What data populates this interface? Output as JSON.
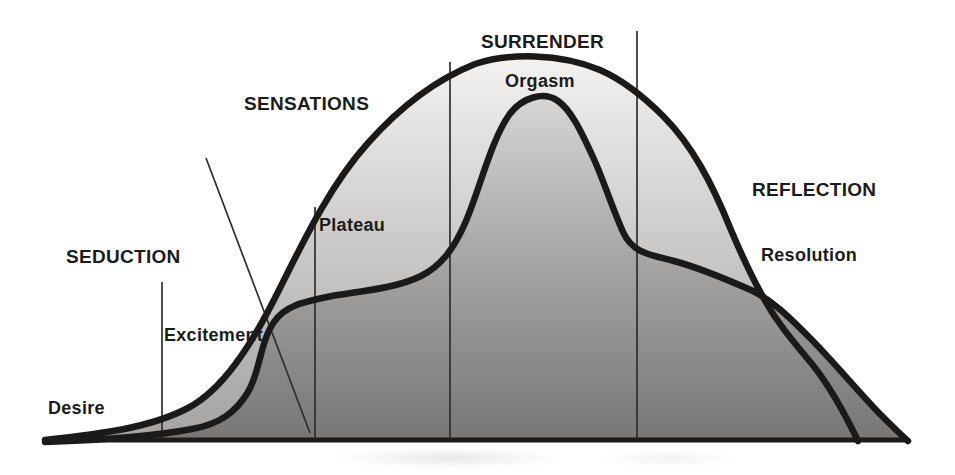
{
  "labels": {
    "seduction": "SEDUCTION",
    "sensations": "SENSATIONS",
    "surrender": "SURRENDER",
    "reflection": "REFLECTION",
    "desire": "Desire",
    "excitement": "Excitement",
    "plateau": "Plateau",
    "orgasm": "Orgasm",
    "resolution": "Resolution"
  },
  "diagram": {
    "kind": "dual-curve response-cycle diagram (scanned book figure)",
    "phases": [
      "SEDUCTION",
      "SENSATIONS",
      "SURRENDER",
      "REFLECTION"
    ],
    "stages": [
      "Desire",
      "Excitement",
      "Plateau",
      "Orgasm",
      "Resolution"
    ],
    "curves": [
      {
        "name": "outer-envelope-curve",
        "description": "large bell curve spanning all four phases, rising from Desire, peaking over Surrender, falling through Reflection to the baseline",
        "stroke": "#1a1a1a"
      },
      {
        "name": "inner-response-curve",
        "description": "curve rising steeply through Excitement, flattening at Plateau, spiking to the Orgasm peak, then a Resolution tail that crosses the envelope and fades out at far right",
        "stroke": "#1a1a1a"
      }
    ],
    "dividers": [
      "seduction-divider (short vertical, left)",
      "sensations-diagonal-divider",
      "plateau-divider (vertical)",
      "surrender-left-divider (vertical)",
      "surrender-right-divider (vertical)"
    ],
    "colors": {
      "background": "#ffffff",
      "curve_stroke": "#1a1a1a",
      "outer_fill_top": "#f4f2f0",
      "outer_fill_bottom": "#a5a3a1",
      "inner_fill_top": "#d8d6d4",
      "inner_fill_bottom": "#787674",
      "divider_line": "#2e2e2e",
      "baseline": "#1b1b1b",
      "text": "#1c1c1c"
    }
  }
}
